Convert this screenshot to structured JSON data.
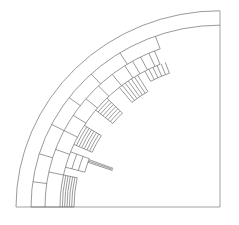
{
  "diagram": {
    "type": "quarter-ring-segmented-cross-section",
    "stroke_color": "#6e6e6e",
    "background": "#ffffff",
    "center": [
      220,
      207
    ],
    "aspect_y": 0.962,
    "frame": {
      "right_x": 220,
      "bottom_y": 207,
      "top_y": 11,
      "left_x": 16
    },
    "full_arcs": [
      204,
      189
    ],
    "partial_rings": [
      {
        "r_outer": 189,
        "r_inner": 175,
        "start_deg": 0,
        "end_deg": 70,
        "dividers_deg": [
          0,
          8,
          17,
          27,
          37,
          47,
          58,
          70
        ]
      },
      {
        "r_outer": 175,
        "r_inner": 160,
        "start_deg": 0,
        "end_deg": 68,
        "dividers_deg": [
          0,
          12,
          20,
          27,
          33,
          40,
          46,
          52,
          57,
          60,
          63,
          66,
          68
        ]
      }
    ],
    "slots": [
      {
        "center_deg": 6,
        "half_width_deg": 6,
        "r_outer": 160,
        "r_inner": 146,
        "lines": 6,
        "orientation": "tangential"
      },
      {
        "center_deg": 18,
        "half_width_deg": 3,
        "r_outer": 160,
        "r_inner": 140,
        "lines": 3,
        "orientation": "tangential"
      },
      {
        "center_deg": 28,
        "half_width_deg": 4,
        "r_outer": 160,
        "r_inner": 140,
        "lines": 7,
        "orientation": "tangential"
      },
      {
        "center_deg": 42,
        "half_width_deg": 3,
        "r_outer": 160,
        "r_inner": 138,
        "lines": 7,
        "orientation": "tangential"
      },
      {
        "center_deg": 55,
        "half_width_deg": 4,
        "r_outer": 160,
        "r_inner": 140,
        "lines": 6,
        "orientation": "radial"
      },
      {
        "center_deg": 66,
        "half_width_deg": 4,
        "r_outer": 160,
        "r_inner": 148,
        "lines": 5,
        "orientation": "radial"
      }
    ],
    "pointer": {
      "angle_deg": 20,
      "r_from": 140,
      "r_to": 114,
      "width": 2
    }
  }
}
